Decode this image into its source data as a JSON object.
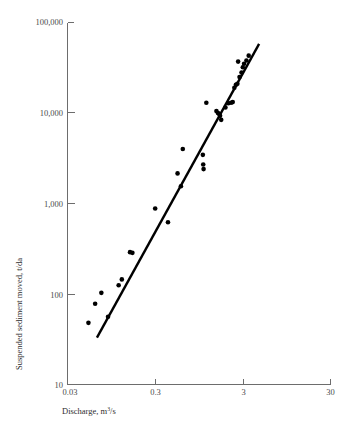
{
  "chart_data": {
    "type": "scatter",
    "title": "",
    "xlabel": "Discharge, m3/s",
    "xlabel_base": "Discharge, m",
    "xlabel_exponent": "3",
    "xlabel_tail": "/s",
    "ylabel": "Suspended sediment moved, t/da",
    "xscale": "log",
    "yscale": "log",
    "xlim": [
      0.03,
      30
    ],
    "ylim": [
      10,
      100000
    ],
    "grid": false,
    "legend": null,
    "xticks": [
      0.03,
      0.3,
      3,
      30
    ],
    "xticklabels": [
      "0.03",
      "0.3",
      "3",
      "30"
    ],
    "yticks": [
      10,
      100,
      1000,
      10000,
      100000
    ],
    "yticklabels": [
      "10",
      "100",
      "1,000",
      "10,000",
      "100,000"
    ],
    "series": [
      {
        "name": "Suspended sediment vs discharge",
        "marker": "filled-circle",
        "color": "#000000",
        "points": [
          [
            0.052,
            48
          ],
          [
            0.062,
            78
          ],
          [
            0.073,
            103
          ],
          [
            0.087,
            56
          ],
          [
            0.115,
            125
          ],
          [
            0.125,
            145
          ],
          [
            0.155,
            290
          ],
          [
            0.165,
            285
          ],
          [
            0.3,
            880
          ],
          [
            0.42,
            620
          ],
          [
            0.54,
            2150
          ],
          [
            0.59,
            1550
          ],
          [
            0.62,
            4000
          ],
          [
            1.05,
            3450
          ],
          [
            1.06,
            2700
          ],
          [
            1.07,
            2400
          ],
          [
            1.15,
            13000
          ],
          [
            1.5,
            10500
          ],
          [
            1.56,
            10000
          ],
          [
            1.6,
            9800
          ],
          [
            1.65,
            9300
          ],
          [
            1.7,
            8400
          ],
          [
            1.9,
            11500
          ],
          [
            2.05,
            12800
          ],
          [
            2.2,
            13000
          ],
          [
            2.3,
            13200
          ],
          [
            2.4,
            19000
          ],
          [
            2.5,
            20500
          ],
          [
            2.6,
            21000
          ],
          [
            2.75,
            25000
          ],
          [
            2.9,
            28000
          ],
          [
            3.0,
            32000
          ],
          [
            3.1,
            35000
          ],
          [
            3.3,
            38000
          ],
          [
            3.5,
            43000
          ],
          [
            2.65,
            37000
          ]
        ]
      }
    ],
    "fit_line": {
      "name": "best-fit line",
      "color": "#000000",
      "x_start": 0.065,
      "y_start": 33,
      "x_end": 4.6,
      "y_end": 58000
    }
  }
}
